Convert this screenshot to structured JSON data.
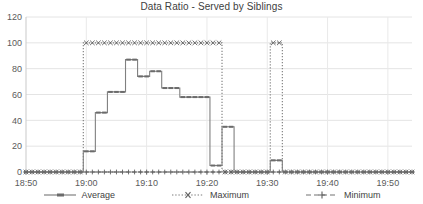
{
  "chart_data": {
    "type": "line",
    "title": "Data Ratio - Served by Siblings",
    "xlabel": "",
    "ylabel": "",
    "ylim": [
      0,
      120
    ],
    "ytick_values": [
      0,
      20,
      40,
      60,
      80,
      100,
      120
    ],
    "ytick_labels": [
      "0",
      "20",
      "40",
      "60",
      "80",
      "100",
      "120"
    ],
    "xlim": [
      "18:50",
      "19:55"
    ],
    "xtick_labels": [
      "18:50",
      "19:00",
      "19:10",
      "19:20",
      "19:30",
      "19:40",
      "19:50"
    ],
    "xtick_minutes": [
      1130,
      1140,
      1150,
      1160,
      1170,
      1180,
      1190
    ],
    "grid": "horizontal-and-vertical",
    "legend_position": "bottom",
    "x_minutes": [
      1130,
      1131,
      1132,
      1133,
      1134,
      1135,
      1136,
      1137,
      1138,
      1139,
      1140,
      1141,
      1142,
      1143,
      1144,
      1145,
      1146,
      1147,
      1148,
      1149,
      1150,
      1151,
      1152,
      1153,
      1154,
      1155,
      1156,
      1157,
      1158,
      1159,
      1160,
      1161,
      1162,
      1163,
      1164,
      1165,
      1166,
      1167,
      1168,
      1169,
      1170,
      1171,
      1172,
      1173,
      1174,
      1175,
      1176,
      1177,
      1178,
      1179,
      1180,
      1181,
      1182,
      1183,
      1184,
      1185,
      1186,
      1187,
      1188,
      1189,
      1190,
      1191,
      1192,
      1193,
      1194
    ],
    "series": [
      {
        "name": "Average",
        "style": "solid",
        "marker": "dash",
        "color": "#808080",
        "values": [
          0,
          0,
          0,
          0,
          0,
          0,
          0,
          0,
          0,
          0,
          16,
          16,
          46,
          46,
          62,
          62,
          62,
          87,
          87,
          74,
          74,
          78,
          78,
          65,
          65,
          65,
          58,
          58,
          58,
          58,
          58,
          5,
          5,
          35,
          35,
          0,
          0,
          0,
          0,
          0,
          0,
          9,
          9,
          0,
          0,
          0,
          0,
          0,
          0,
          0,
          0,
          0,
          0,
          0,
          0,
          0,
          0,
          0,
          0,
          0,
          0,
          0,
          0,
          0,
          0
        ]
      },
      {
        "name": "Maximum",
        "style": "dotted",
        "marker": "x",
        "color": "#7a7a7a",
        "values": [
          0,
          0,
          0,
          0,
          0,
          0,
          0,
          0,
          0,
          0,
          100,
          100,
          100,
          100,
          100,
          100,
          100,
          100,
          100,
          100,
          100,
          100,
          100,
          100,
          100,
          100,
          100,
          100,
          100,
          100,
          100,
          100,
          100,
          0,
          0,
          0,
          0,
          0,
          0,
          0,
          0,
          100,
          100,
          0,
          0,
          0,
          0,
          0,
          0,
          0,
          0,
          0,
          0,
          0,
          0,
          0,
          0,
          0,
          0,
          0,
          0,
          0,
          0,
          0,
          0
        ]
      },
      {
        "name": "Minimum",
        "style": "dashed",
        "marker": "plus",
        "color": "#737373",
        "values": [
          0,
          0,
          0,
          0,
          0,
          0,
          0,
          0,
          0,
          0,
          0,
          0,
          0,
          0,
          0,
          0,
          0,
          0,
          0,
          0,
          0,
          0,
          0,
          0,
          0,
          0,
          0,
          0,
          0,
          0,
          0,
          0,
          0,
          0,
          0,
          0,
          0,
          0,
          0,
          0,
          0,
          0,
          0,
          0,
          0,
          0,
          0,
          0,
          0,
          0,
          0,
          0,
          0,
          0,
          0,
          0,
          0,
          0,
          0,
          0,
          0,
          0,
          0,
          0,
          0
        ]
      }
    ]
  },
  "legend": {
    "items": [
      {
        "label": "Average"
      },
      {
        "label": "Maximum"
      },
      {
        "label": "Minimum"
      }
    ]
  }
}
